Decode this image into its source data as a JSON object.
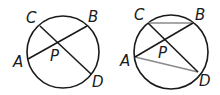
{
  "figures": [
    {
      "name": "circle-with-intersecting-chords",
      "labels": {
        "C": "C",
        "B": "B",
        "A": "A",
        "D": "D",
        "P": "P"
      }
    },
    {
      "name": "circle-with-chords-and-triangles",
      "labels": {
        "C": "C",
        "B": "B",
        "A": "A",
        "D": "D",
        "P": "P"
      }
    }
  ],
  "colors": {
    "stroke": "#1a1a1a",
    "gray_chord": "#8a8a8a"
  }
}
